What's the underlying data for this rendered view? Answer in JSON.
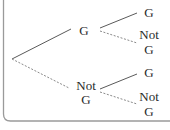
{
  "diagram": {
    "type": "probability-tree",
    "colors": {
      "frame": "#9a9a9a",
      "solid_branch": "#5a5a5a",
      "dashed_branch": "#8a8a8a",
      "text": "#2a2a2a"
    },
    "level1": [
      {
        "line1": "G",
        "line2": "",
        "branch_style": "solid"
      },
      {
        "line1": "Not",
        "line2": "G",
        "branch_style": "dashed"
      }
    ],
    "level2": [
      {
        "parent": 0,
        "line1": "G",
        "line2": "",
        "branch_style": "solid"
      },
      {
        "parent": 0,
        "line1": "Not",
        "line2": "G",
        "branch_style": "dashed"
      },
      {
        "parent": 1,
        "line1": "G",
        "line2": "",
        "branch_style": "solid"
      },
      {
        "parent": 1,
        "line1": "Not",
        "line2": "G",
        "branch_style": "dashed"
      }
    ]
  }
}
